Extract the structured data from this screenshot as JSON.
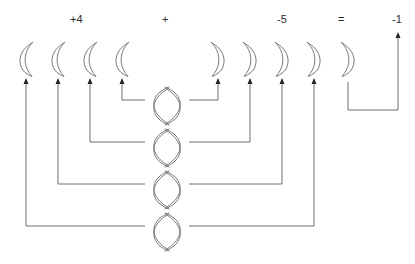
{
  "figure": {
    "background_color": "#ffffff",
    "stroke_color": "#555555",
    "text_color": "#2b2b2b"
  },
  "equation": {
    "terms": [
      {
        "id": "term-first",
        "sign": "+",
        "magnitude": "4",
        "text": "+4",
        "x": 76,
        "y": 20
      },
      {
        "id": "operator-plus",
        "text": "+",
        "x": 166,
        "y": 20
      },
      {
        "id": "term-second",
        "sign": "-",
        "magnitude": "5",
        "text": "-5",
        "x": 283,
        "y": 20
      },
      {
        "id": "operator-equals",
        "text": "=",
        "x": 342,
        "y": 20
      },
      {
        "id": "term-result",
        "sign": "-",
        "magnitude": "1",
        "text": "-1",
        "x": 398,
        "y": 20
      }
    ]
  },
  "counters": {
    "positive_label": "positive-counter",
    "negative_label": "negative-counter",
    "row_y": 58,
    "positive": [
      {
        "index": 1,
        "cx": 26,
        "value": "+1"
      },
      {
        "index": 2,
        "cx": 58,
        "value": "+1"
      },
      {
        "index": 3,
        "cx": 90,
        "value": "+1"
      },
      {
        "index": 4,
        "cx": 122,
        "value": "+1"
      }
    ],
    "negative": [
      {
        "index": 1,
        "cx": 218,
        "value": "-1"
      },
      {
        "index": 2,
        "cx": 250,
        "value": "-1"
      },
      {
        "index": 3,
        "cx": 282,
        "value": "-1"
      },
      {
        "index": 4,
        "cx": 314,
        "value": "-1"
      },
      {
        "index": 5,
        "cx": 348,
        "value": "-1"
      }
    ]
  },
  "zero_pairs": [
    {
      "index": 1,
      "cx": 167,
      "cy": 106,
      "left_counter": 4,
      "right_counter": 1,
      "left_x": 122,
      "right_x": 218,
      "bus_y": 100,
      "value": "0"
    },
    {
      "index": 2,
      "cx": 167,
      "cy": 148,
      "left_counter": 3,
      "right_counter": 2,
      "left_x": 90,
      "right_x": 250,
      "bus_y": 142,
      "value": "0"
    },
    {
      "index": 3,
      "cx": 167,
      "cy": 190,
      "left_counter": 2,
      "right_counter": 3,
      "left_x": 58,
      "right_x": 282,
      "bus_y": 184,
      "value": "0"
    },
    {
      "index": 4,
      "cx": 167,
      "cy": 232,
      "left_counter": 1,
      "right_counter": 4,
      "left_x": 26,
      "right_x": 314,
      "bus_y": 226,
      "value": "0"
    }
  ],
  "result_bracket": {
    "from_counter": 5,
    "left_x": 348,
    "right_x": 398,
    "bottom_y": 110,
    "top_y": 82,
    "arrow_target_y": 32
  },
  "arrows": {
    "head_length": 6,
    "head_width": 5,
    "tip_y": 78,
    "direction": "up"
  }
}
